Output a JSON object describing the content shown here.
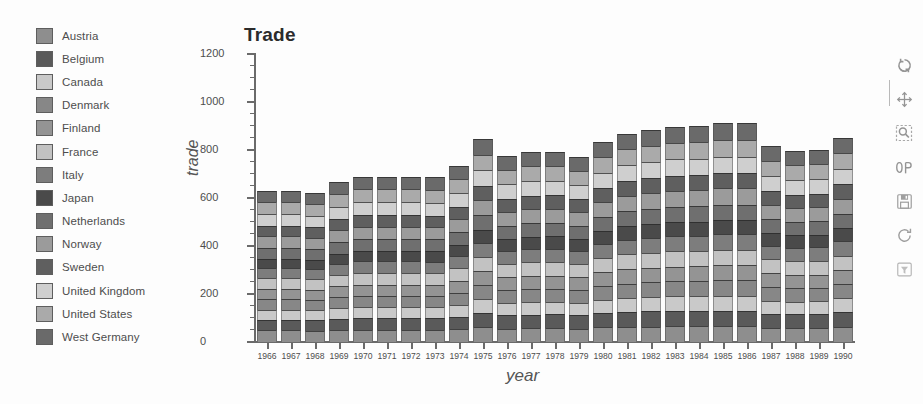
{
  "legend": {
    "items": [
      {
        "label": "Austria",
        "color": "#8e8e8e"
      },
      {
        "label": "Belgium",
        "color": "#5a5a5a"
      },
      {
        "label": "Canada",
        "color": "#c9c9c9"
      },
      {
        "label": "Denmark",
        "color": "#878787"
      },
      {
        "label": "Finland",
        "color": "#949494"
      },
      {
        "label": "France",
        "color": "#c2c2c2"
      },
      {
        "label": "Italy",
        "color": "#7d7d7d"
      },
      {
        "label": "Japan",
        "color": "#4a4a4a"
      },
      {
        "label": "Netherlands",
        "color": "#6f6f6f"
      },
      {
        "label": "Norway",
        "color": "#9b9b9b"
      },
      {
        "label": "Sweden",
        "color": "#5f5f5f"
      },
      {
        "label": "United Kingdom",
        "color": "#cfcfcf"
      },
      {
        "label": "United States",
        "color": "#aaaaaa"
      },
      {
        "label": "West Germany",
        "color": "#6a6a6a"
      }
    ]
  },
  "chart_data": {
    "type": "bar",
    "stacked": true,
    "title": "Trade",
    "xlabel": "year",
    "ylabel": "trade",
    "grid": false,
    "legend_position": "left",
    "ylim": [
      0,
      1200
    ],
    "yticks": [
      0,
      200,
      400,
      600,
      800,
      1000,
      1200
    ],
    "ytick_labels": [
      "0",
      "200",
      "400",
      "600",
      "800",
      "1000",
      "1200"
    ],
    "minor_ticks": true,
    "categories": [
      "1966",
      "1967",
      "1968",
      "1969",
      "1970",
      "1971",
      "1972",
      "1973",
      "1974",
      "1975",
      "1976",
      "1977",
      "1978",
      "1979",
      "1980",
      "1981",
      "1982",
      "1983",
      "1984",
      "1985",
      "1986",
      "1987",
      "1988",
      "1989",
      "1990"
    ],
    "series": [
      {
        "name": "Austria",
        "color": "#8e8e8e",
        "values": [
          48,
          48,
          47,
          51,
          52,
          52,
          52,
          55,
          57,
          62,
          58,
          60,
          60,
          58,
          63,
          66,
          67,
          68,
          69,
          69,
          69,
          63,
          60,
          61,
          65
        ]
      },
      {
        "name": "Belgium",
        "color": "#5a5a5a",
        "values": [
          45,
          45,
          44,
          47,
          50,
          50,
          50,
          52,
          56,
          62,
          57,
          58,
          59,
          57,
          61,
          65,
          66,
          67,
          68,
          68,
          68,
          61,
          58,
          59,
          63
        ]
      },
      {
        "name": "Canada",
        "color": "#c9c9c9",
        "values": [
          41,
          41,
          40,
          43,
          46,
          46,
          46,
          49,
          52,
          58,
          54,
          55,
          55,
          54,
          58,
          61,
          63,
          64,
          65,
          65,
          65,
          58,
          55,
          56,
          60
        ]
      },
      {
        "name": "Denmark",
        "color": "#878787",
        "values": [
          44,
          44,
          43,
          46,
          48,
          48,
          48,
          51,
          54,
          60,
          56,
          57,
          57,
          56,
          60,
          63,
          64,
          65,
          66,
          66,
          66,
          60,
          57,
          58,
          61
        ]
      },
      {
        "name": "Finland",
        "color": "#949494",
        "values": [
          42,
          42,
          41,
          45,
          47,
          47,
          47,
          50,
          53,
          59,
          55,
          56,
          56,
          55,
          59,
          62,
          63,
          64,
          65,
          65,
          65,
          59,
          56,
          57,
          60
        ]
      },
      {
        "name": "France",
        "color": "#c2c2c2",
        "values": [
          46,
          46,
          45,
          48,
          51,
          51,
          51,
          53,
          57,
          63,
          58,
          59,
          60,
          58,
          62,
          66,
          67,
          68,
          69,
          69,
          69,
          62,
          59,
          60,
          64
        ]
      },
      {
        "name": "Italy",
        "color": "#7d7d7d",
        "values": [
          43,
          43,
          42,
          46,
          48,
          48,
          48,
          51,
          54,
          60,
          56,
          57,
          57,
          56,
          60,
          63,
          64,
          65,
          66,
          66,
          66,
          60,
          57,
          58,
          61
        ]
      },
      {
        "name": "Japan",
        "color": "#4a4a4a",
        "values": [
          39,
          39,
          38,
          42,
          44,
          44,
          44,
          47,
          50,
          56,
          52,
          53,
          53,
          52,
          56,
          59,
          60,
          61,
          62,
          62,
          62,
          56,
          53,
          54,
          57
        ]
      },
      {
        "name": "Netherlands",
        "color": "#6f6f6f",
        "values": [
          45,
          45,
          44,
          48,
          50,
          50,
          50,
          53,
          56,
          62,
          58,
          59,
          59,
          57,
          62,
          65,
          66,
          67,
          68,
          68,
          68,
          61,
          58,
          59,
          63
        ]
      },
      {
        "name": "Norway",
        "color": "#9b9b9b",
        "values": [
          47,
          47,
          46,
          50,
          52,
          52,
          52,
          55,
          58,
          64,
          60,
          61,
          61,
          59,
          64,
          67,
          68,
          69,
          70,
          70,
          70,
          63,
          60,
          61,
          65
        ]
      },
      {
        "name": "Sweden",
        "color": "#5f5f5f",
        "values": [
          44,
          44,
          43,
          47,
          49,
          49,
          49,
          52,
          55,
          61,
          57,
          58,
          58,
          56,
          61,
          64,
          65,
          66,
          67,
          67,
          67,
          60,
          57,
          58,
          62
        ]
      },
      {
        "name": "United Kingdom",
        "color": "#cfcfcf",
        "values": [
          49,
          49,
          48,
          52,
          54,
          54,
          54,
          57,
          60,
          66,
          62,
          63,
          63,
          61,
          66,
          69,
          70,
          71,
          72,
          72,
          72,
          65,
          62,
          63,
          67
        ]
      },
      {
        "name": "United States",
        "color": "#aaaaaa",
        "values": [
          50,
          50,
          49,
          53,
          55,
          55,
          55,
          58,
          61,
          67,
          63,
          64,
          64,
          62,
          67,
          70,
          71,
          72,
          73,
          73,
          73,
          66,
          63,
          64,
          68
        ]
      },
      {
        "name": "West Germany",
        "color": "#6a6a6a",
        "values": [
          47,
          47,
          46,
          50,
          52,
          52,
          52,
          56,
          59,
          65,
          61,
          62,
          62,
          60,
          65,
          68,
          69,
          70,
          71,
          71,
          71,
          64,
          61,
          62,
          66
        ]
      }
    ],
    "totals": [
      630,
      630,
      622,
      667,
      688,
      688,
      688,
      686,
      733,
      845,
      777,
      792,
      794,
      771,
      834,
      868,
      883,
      897,
      901,
      911,
      911,
      815,
      796,
      800,
      852
    ]
  },
  "toolbar": {
    "buttons": [
      {
        "name": "home-icon",
        "tooltip": "Reset original view"
      },
      {
        "name": "move-icon",
        "tooltip": "Pan axes"
      },
      {
        "name": "zoom-rect-icon",
        "tooltip": "Zoom to rectangle"
      },
      {
        "name": "subplots-icon",
        "tooltip": "Configure subplots"
      },
      {
        "name": "save-icon",
        "tooltip": "Save the figure"
      },
      {
        "name": "refresh-icon",
        "tooltip": "Refresh"
      },
      {
        "name": "filter-icon",
        "tooltip": "Filter"
      }
    ]
  }
}
